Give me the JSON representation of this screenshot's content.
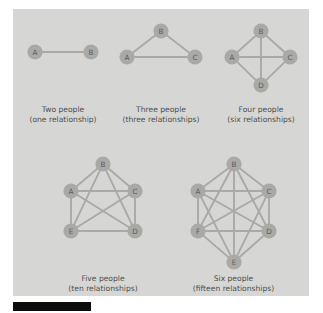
{
  "figure": {
    "background_color": "#d6d6d4",
    "node_color": "#a9a9a7",
    "edge_color": "#a9a9a7",
    "label_color": "#5d5d5b",
    "caption_color": "#4f4f4d",
    "bar_color": "#0c0c0c"
  },
  "diagrams": [
    {
      "id": "two-people",
      "caption_line1": "Two people",
      "caption_line2": "(one relationship)",
      "people_count": 2,
      "relationship_count": 1,
      "nodes": [
        {
          "label": "A",
          "x": 22,
          "y": 43
        },
        {
          "label": "B",
          "x": 78,
          "y": 43
        }
      ],
      "edges": [
        [
          0,
          1
        ]
      ]
    },
    {
      "id": "three-people",
      "caption_line1": "Three people",
      "caption_line2": "(three relationships)",
      "people_count": 3,
      "relationship_count": 3,
      "nodes": [
        {
          "label": "B",
          "x": 148,
          "y": 22
        },
        {
          "label": "A",
          "x": 114,
          "y": 48
        },
        {
          "label": "C",
          "x": 182,
          "y": 48
        }
      ],
      "edges": [
        [
          0,
          1
        ],
        [
          0,
          2
        ],
        [
          1,
          2
        ]
      ]
    },
    {
      "id": "four-people",
      "caption_line1": "Four people",
      "caption_line2": "(six relationships)",
      "people_count": 4,
      "relationship_count": 6,
      "nodes": [
        {
          "label": "B",
          "x": 248,
          "y": 22
        },
        {
          "label": "A",
          "x": 219,
          "y": 48
        },
        {
          "label": "C",
          "x": 277,
          "y": 48
        },
        {
          "label": "D",
          "x": 248,
          "y": 76
        }
      ],
      "edges": [
        [
          0,
          1
        ],
        [
          0,
          2
        ],
        [
          0,
          3
        ],
        [
          1,
          2
        ],
        [
          1,
          3
        ],
        [
          2,
          3
        ]
      ]
    },
    {
      "id": "five-people",
      "caption_line1": "Five people",
      "caption_line2": "(ten relationships)",
      "people_count": 5,
      "relationship_count": 10,
      "nodes": [
        {
          "label": "B",
          "x": 90,
          "y": 155
        },
        {
          "label": "A",
          "x": 58,
          "y": 182
        },
        {
          "label": "C",
          "x": 122,
          "y": 182
        },
        {
          "label": "E",
          "x": 58,
          "y": 222
        },
        {
          "label": "D",
          "x": 122,
          "y": 222
        }
      ],
      "edges": [
        [
          0,
          1
        ],
        [
          0,
          2
        ],
        [
          0,
          3
        ],
        [
          0,
          4
        ],
        [
          1,
          2
        ],
        [
          1,
          3
        ],
        [
          1,
          4
        ],
        [
          2,
          3
        ],
        [
          2,
          4
        ],
        [
          3,
          4
        ]
      ]
    },
    {
      "id": "six-people",
      "caption_line1": "Six people",
      "caption_line2": "(fifteen relationships)",
      "people_count": 6,
      "relationship_count": 15,
      "nodes": [
        {
          "label": "B",
          "x": 221,
          "y": 155
        },
        {
          "label": "A",
          "x": 185,
          "y": 182
        },
        {
          "label": "C",
          "x": 256,
          "y": 182
        },
        {
          "label": "F",
          "x": 185,
          "y": 222
        },
        {
          "label": "D",
          "x": 256,
          "y": 222
        },
        {
          "label": "E",
          "x": 221,
          "y": 253
        }
      ],
      "edges": [
        [
          0,
          1
        ],
        [
          0,
          2
        ],
        [
          0,
          3
        ],
        [
          0,
          4
        ],
        [
          0,
          5
        ],
        [
          1,
          2
        ],
        [
          1,
          3
        ],
        [
          1,
          4
        ],
        [
          1,
          5
        ],
        [
          2,
          3
        ],
        [
          2,
          4
        ],
        [
          2,
          5
        ],
        [
          3,
          4
        ],
        [
          3,
          5
        ],
        [
          4,
          5
        ]
      ]
    }
  ],
  "captions": {
    "row1_y_line1": 103,
    "row1_y_line2": 113,
    "row2_y_line1": 272,
    "row2_y_line2": 282
  },
  "node_radius": 7.6
}
